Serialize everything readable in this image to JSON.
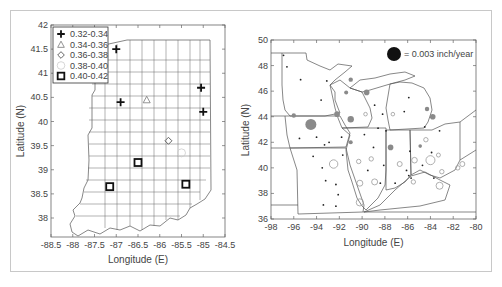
{
  "chart_data": [
    {
      "type": "scatter",
      "subtype": "map",
      "region": "Indiana (county boundaries)",
      "xlabel": "Longitude (E)",
      "ylabel": "Latitude (N)",
      "xlim": [
        -88.5,
        -84.5
      ],
      "ylim": [
        37.6,
        42
      ],
      "xticks": [
        "-88.5",
        "-88",
        "-87.5",
        "-87",
        "-86.5",
        "-86",
        "-85.5",
        "-85",
        "-84.5"
      ],
      "yticks": [
        "42",
        "41.5",
        "41",
        "40.5",
        "40",
        "39.5",
        "39",
        "38.5",
        "38"
      ],
      "legend_position": "upper left",
      "legend": [
        {
          "label": "0.32-0.34",
          "marker": "plus"
        },
        {
          "label": "0.34-0.36",
          "marker": "triangle"
        },
        {
          "label": "0.36-0.38",
          "marker": "diamond"
        },
        {
          "label": "0.38-0.40",
          "marker": "circle"
        },
        {
          "label": "0.40-0.42",
          "marker": "square"
        }
      ],
      "points": [
        {
          "lon": -87.0,
          "lat": 41.5,
          "class": "0.32-0.34"
        },
        {
          "lon": -86.9,
          "lat": 40.4,
          "class": "0.32-0.34"
        },
        {
          "lon": -85.05,
          "lat": 40.7,
          "class": "0.32-0.34"
        },
        {
          "lon": -85.0,
          "lat": 40.2,
          "class": "0.32-0.34"
        },
        {
          "lon": -86.3,
          "lat": 40.45,
          "class": "0.34-0.36"
        },
        {
          "lon": -85.8,
          "lat": 39.6,
          "class": "0.36-0.38"
        },
        {
          "lon": -85.5,
          "lat": 39.35,
          "class": "0.38-0.40"
        },
        {
          "lon": -86.5,
          "lat": 39.15,
          "class": "0.40-0.42"
        },
        {
          "lon": -87.15,
          "lat": 38.65,
          "class": "0.40-0.42"
        },
        {
          "lon": -85.4,
          "lat": 38.7,
          "class": "0.40-0.42"
        }
      ]
    },
    {
      "type": "scatter",
      "subtype": "bubble-map",
      "region": "Upper Midwest US states",
      "xlabel": "Longitude (E)",
      "ylabel": "Latitude (N)",
      "xlim": [
        -98,
        -80
      ],
      "ylim": [
        36,
        50
      ],
      "xticks": [
        "-98",
        "-96",
        "-94",
        "-92",
        "-90",
        "-88",
        "-86",
        "-84",
        "-82",
        "-80"
      ],
      "yticks": [
        "50",
        "48",
        "46",
        "44",
        "42",
        "40",
        "38",
        "36"
      ],
      "size_legend": "= 0.003 inch/year",
      "series": [
        {
          "name": "increase (filled)",
          "color": "#8a8a8a",
          "points": [
            {
              "lon": -94.5,
              "lat": 43.4,
              "r": 5.5
            },
            {
              "lon": -92.2,
              "lat": 44.2,
              "r": 2.8
            },
            {
              "lon": -91.0,
              "lat": 43.8,
              "r": 3.2
            },
            {
              "lon": -91.0,
              "lat": 46.9,
              "r": 2.2
            },
            {
              "lon": -91.4,
              "lat": 45.9,
              "r": 2.0
            },
            {
              "lon": -89.6,
              "lat": 45.9,
              "r": 2.8
            },
            {
              "lon": -96.0,
              "lat": 44.1,
              "r": 2.2
            },
            {
              "lon": -91.0,
              "lat": 42.0,
              "r": 2.0
            },
            {
              "lon": -84.3,
              "lat": 44.6,
              "r": 2.2
            },
            {
              "lon": -83.8,
              "lat": 44.0,
              "r": 2.8
            },
            {
              "lon": -87.5,
              "lat": 41.6,
              "r": 2.8
            },
            {
              "lon": -84.9,
              "lat": 41.7,
              "r": 1.8
            }
          ]
        },
        {
          "name": "decrease (open)",
          "color": "#9a9a9a",
          "points": [
            {
              "lon": -92.5,
              "lat": 40.3,
              "r": 4.2
            },
            {
              "lon": -90.3,
              "lat": 40.5,
              "r": 2.2
            },
            {
              "lon": -89.2,
              "lat": 40.7,
              "r": 2.2
            },
            {
              "lon": -90.2,
              "lat": 38.8,
              "r": 3.0
            },
            {
              "lon": -88.9,
              "lat": 38.9,
              "r": 3.0
            },
            {
              "lon": -90.2,
              "lat": 37.3,
              "r": 3.6
            },
            {
              "lon": -89.7,
              "lat": 44.2,
              "r": 1.8
            },
            {
              "lon": -87.3,
              "lat": 44.2,
              "r": 1.8
            },
            {
              "lon": -84.4,
              "lat": 42.2,
              "r": 2.2
            },
            {
              "lon": -86.7,
              "lat": 40.3,
              "r": 2.5
            },
            {
              "lon": -85.4,
              "lat": 40.6,
              "r": 2.8
            },
            {
              "lon": -84.0,
              "lat": 40.6,
              "r": 4.5
            },
            {
              "lon": -83.3,
              "lat": 41.0,
              "r": 2.0
            },
            {
              "lon": -83.0,
              "lat": 39.7,
              "r": 2.2
            },
            {
              "lon": -85.5,
              "lat": 38.9,
              "r": 2.2
            },
            {
              "lon": -83.2,
              "lat": 38.6,
              "r": 3.5
            },
            {
              "lon": -81.6,
              "lat": 40.0,
              "r": 2.2
            },
            {
              "lon": -81.2,
              "lat": 40.3,
              "r": 2.5
            }
          ]
        },
        {
          "name": "small (dots)",
          "color": "#222222",
          "points": [
            {
              "lon": -96.9,
              "lat": 48.8
            },
            {
              "lon": -96.6,
              "lat": 47.9
            },
            {
              "lon": -95.4,
              "lat": 46.9
            },
            {
              "lon": -93.1,
              "lat": 46.8
            },
            {
              "lon": -93.6,
              "lat": 45.3
            },
            {
              "lon": -88.9,
              "lat": 44.9
            },
            {
              "lon": -88.2,
              "lat": 44.2
            },
            {
              "lon": -88.6,
              "lat": 43.1
            },
            {
              "lon": -89.8,
              "lat": 42.6
            },
            {
              "lon": -95.5,
              "lat": 42.3
            },
            {
              "lon": -94.0,
              "lat": 42.4
            },
            {
              "lon": -93.3,
              "lat": 41.8
            },
            {
              "lon": -91.8,
              "lat": 42.4
            },
            {
              "lon": -92.9,
              "lat": 42.0
            },
            {
              "lon": -91.7,
              "lat": 41.0
            },
            {
              "lon": -94.3,
              "lat": 40.9
            },
            {
              "lon": -93.5,
              "lat": 40.0
            },
            {
              "lon": -93.2,
              "lat": 39.0
            },
            {
              "lon": -92.3,
              "lat": 38.7
            },
            {
              "lon": -92.1,
              "lat": 37.9
            },
            {
              "lon": -93.4,
              "lat": 37.1
            },
            {
              "lon": -92.3,
              "lat": 37.0
            },
            {
              "lon": -89.0,
              "lat": 41.6
            },
            {
              "lon": -88.1,
              "lat": 40.2
            },
            {
              "lon": -89.5,
              "lat": 39.8
            },
            {
              "lon": -88.4,
              "lat": 38.8
            },
            {
              "lon": -87.1,
              "lat": 38.8
            },
            {
              "lon": -86.1,
              "lat": 39.8
            },
            {
              "lon": -85.9,
              "lat": 39.4
            },
            {
              "lon": -85.7,
              "lat": 39.2
            },
            {
              "lon": -84.7,
              "lat": 40.2
            },
            {
              "lon": -83.7,
              "lat": 39.2
            },
            {
              "lon": -84.5,
              "lat": 43.2
            },
            {
              "lon": -83.2,
              "lat": 42.9
            },
            {
              "lon": -85.8,
              "lat": 41.3
            },
            {
              "lon": -86.3,
              "lat": 44.4
            },
            {
              "lon": -85.9,
              "lat": 45.5
            },
            {
              "lon": -87.9,
              "lat": 42.9
            },
            {
              "lon": -83.9,
              "lat": 41.2
            }
          ]
        }
      ],
      "size_legend_marker": {
        "color": "#111111",
        "r": 7
      }
    }
  ]
}
